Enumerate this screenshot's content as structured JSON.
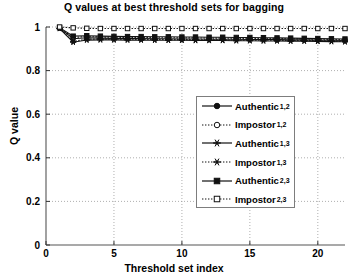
{
  "chart_data": {
    "type": "line",
    "title": "Q values at best threshold sets for bagging",
    "xlabel": "Threshold set index",
    "ylabel": "Q value",
    "xlim": [
      0,
      22
    ],
    "ylim": [
      0,
      1
    ],
    "xticks": [
      0,
      5,
      10,
      15,
      20
    ],
    "yticks": [
      0,
      0.2,
      0.4,
      0.6,
      0.8,
      1
    ],
    "ytick_labels": [
      "0",
      "0.2",
      "0.4",
      "0.6",
      "0.8",
      "1"
    ],
    "xtick_labels": [
      "0",
      "5",
      "10",
      "15",
      "20"
    ],
    "grid": "dotted-both",
    "legend_position": "center-right",
    "x": [
      1,
      2,
      3,
      4,
      5,
      6,
      7,
      8,
      9,
      10,
      11,
      12,
      13,
      14,
      15,
      16,
      17,
      18,
      19,
      20,
      21,
      22
    ],
    "series": [
      {
        "name": "Authentic",
        "subscript": "1,2",
        "style": "solid",
        "marker": "circle",
        "values": [
          0.995,
          0.946,
          0.951,
          0.949,
          0.948,
          0.947,
          0.947,
          0.946,
          0.946,
          0.945,
          0.945,
          0.944,
          0.944,
          0.944,
          0.943,
          0.943,
          0.942,
          0.941,
          0.941,
          0.94,
          0.939,
          0.938
        ]
      },
      {
        "name": "Impostor",
        "subscript": "1,2",
        "style": "dotted",
        "marker": "circle-open",
        "values": [
          0.996,
          0.952,
          0.956,
          0.954,
          0.953,
          0.952,
          0.952,
          0.951,
          0.951,
          0.95,
          0.95,
          0.949,
          0.949,
          0.948,
          0.948,
          0.947,
          0.947,
          0.946,
          0.945,
          0.944,
          0.943,
          0.942
        ]
      },
      {
        "name": "Authentic",
        "subscript": "1,3",
        "style": "solid",
        "marker": "star",
        "values": [
          0.993,
          0.93,
          0.94,
          0.941,
          0.941,
          0.94,
          0.94,
          0.939,
          0.939,
          0.939,
          0.938,
          0.938,
          0.938,
          0.937,
          0.937,
          0.936,
          0.936,
          0.935,
          0.935,
          0.934,
          0.933,
          0.932
        ]
      },
      {
        "name": "Impostor",
        "subscript": "1,3",
        "style": "dotted",
        "marker": "star",
        "values": [
          0.994,
          0.934,
          0.944,
          0.945,
          0.944,
          0.944,
          0.943,
          0.943,
          0.942,
          0.942,
          0.942,
          0.941,
          0.941,
          0.94,
          0.94,
          0.939,
          0.939,
          0.938,
          0.938,
          0.937,
          0.936,
          0.935
        ]
      },
      {
        "name": "Authentic",
        "subscript": "2,3",
        "style": "solid",
        "marker": "square",
        "values": [
          0.997,
          0.958,
          0.96,
          0.958,
          0.957,
          0.956,
          0.956,
          0.955,
          0.955,
          0.954,
          0.954,
          0.953,
          0.953,
          0.952,
          0.952,
          0.951,
          0.95,
          0.949,
          0.948,
          0.947,
          0.946,
          0.945
        ]
      },
      {
        "name": "Impostor",
        "subscript": "2,3",
        "style": "dotted",
        "marker": "square-open",
        "values": [
          1.0,
          0.996,
          0.994,
          0.993,
          0.993,
          0.993,
          0.993,
          0.993,
          0.993,
          0.993,
          0.993,
          0.993,
          0.993,
          0.993,
          0.993,
          0.993,
          0.993,
          0.993,
          0.993,
          0.993,
          0.993,
          0.993
        ]
      }
    ],
    "legend_entries": [
      {
        "label": "Authentic",
        "sub": "1,2",
        "style": "solid",
        "marker": "circle"
      },
      {
        "label": "Impostor",
        "sub": "1,2",
        "style": "dotted",
        "marker": "circle-open"
      },
      {
        "label": "Authentic",
        "sub": "1,3",
        "style": "solid",
        "marker": "star"
      },
      {
        "label": "Impostor",
        "sub": "1,3",
        "style": "dotted",
        "marker": "star"
      },
      {
        "label": "Authentic",
        "sub": "2,3",
        "style": "solid",
        "marker": "square"
      },
      {
        "label": "Impostor",
        "sub": "2,3",
        "style": "dotted",
        "marker": "square-open"
      }
    ]
  }
}
